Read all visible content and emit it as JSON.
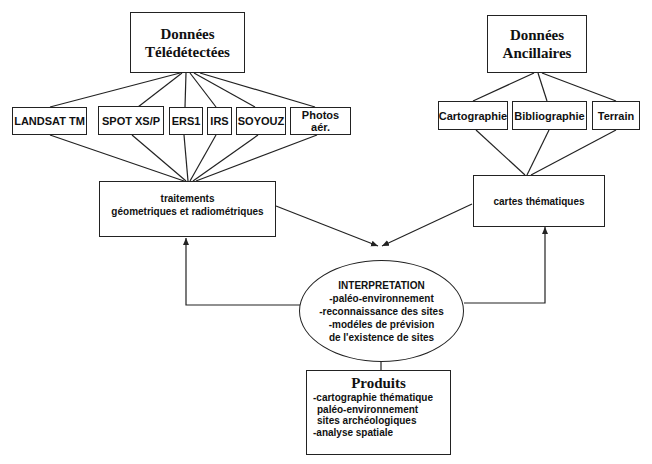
{
  "diagram": {
    "remote_sensing": {
      "title_line1": "Données",
      "title_line2": "Télédétectées",
      "sources": [
        "LANDSAT TM",
        "SPOT XS/P",
        "ERS1",
        "IRS",
        "SOYOUZ",
        "Photos aér."
      ]
    },
    "ancillary": {
      "title_line1": "Données",
      "title_line2": "Ancillaires",
      "sources": [
        "Cartographie",
        "Bibliographie",
        "Terrain"
      ]
    },
    "processing": {
      "line1": "traitements",
      "line2": "géometriques et radiométriques"
    },
    "thematic_maps": {
      "label": "cartes thématiques"
    },
    "interpretation": {
      "title": "INTERPRETATION",
      "items": [
        "-paléo-environnement",
        "-reconnaissance des sites",
        "-modéles de prévision",
        "de l'existence de sites"
      ]
    },
    "products": {
      "title": "Produits",
      "items": [
        "-cartographie thématique",
        "paléo-environnement",
        "sites archéologiques",
        "-analyse spatiale"
      ]
    },
    "colors": {
      "line": "#222222",
      "background": "#ffffff",
      "text": "#111111"
    }
  }
}
